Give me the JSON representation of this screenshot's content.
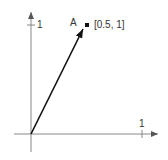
{
  "diagram": {
    "type": "vector-plot",
    "y_axis": {
      "tick_label": "1"
    },
    "x_axis": {
      "tick_label": "1"
    },
    "point": {
      "name": "A",
      "coords_label": "[0.5, 1]",
      "x": 0.5,
      "y": 1
    },
    "vector": {
      "from": [
        0,
        0
      ],
      "to": [
        0.5,
        1
      ]
    },
    "colors": {
      "axis": "#888888",
      "vector": "#111111",
      "text": "#333333"
    }
  }
}
